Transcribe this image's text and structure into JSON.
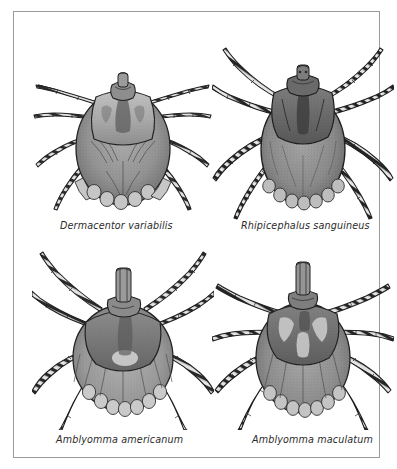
{
  "page": {
    "kind": "scientific-illustration-plate",
    "background_color": "#ffffff",
    "frame_color": "#9a9a9a",
    "text_color": "#2b2b2b",
    "layout": "2x2 grid of tick illustrations with italic species captions"
  },
  "figures": [
    {
      "id": "dermacentor-variabilis",
      "label": "Dermacentor variabilis",
      "common_name": "",
      "position": "top-left",
      "art": {
        "style": "grayscale stippled ink drawing, dorsal view",
        "body_fill": "#8d8d8d",
        "scutum_fill": "#a8a8a8",
        "outline": "#2a2a2a",
        "leg_bands": "alternating dark and pale bands",
        "festoons": 11,
        "legs": 8,
        "body_shape": "broad oval / teardrop",
        "scutum_shape": "broad ornate scutum covering front third",
        "notes": "American dog tick; ornate pale mottled scutum, fan-shaped striations on idiosoma"
      }
    },
    {
      "id": "rhipicephalus-sanguineus",
      "label": "Rhipicephalus sanguineus",
      "common_name": "",
      "position": "top-right",
      "art": {
        "style": "grayscale stippled ink drawing, dorsal view",
        "body_fill": "#8a8a8a",
        "scutum_fill": "#6e6e6e",
        "outline": "#262626",
        "leg_bands": "strongly banded, long splayed legs",
        "festoons": 11,
        "legs": 8,
        "body_shape": "narrow elongate oval",
        "scutum_shape": "dark hexagonal scutum, inornate",
        "notes": "Brown dog tick; hexagonal basis capituli, long outward-sweeping legs"
      }
    },
    {
      "id": "amblyomma-americanum",
      "label": "Amblyomma americanum",
      "common_name": "",
      "position": "bottom-left",
      "art": {
        "style": "grayscale stippled ink drawing, dorsal view",
        "body_fill": "#9b9b9b",
        "scutum_fill": "#7c7c7c",
        "outline": "#2a2a2a",
        "leg_bands": "banded legs, long capitulum",
        "festoons": 11,
        "legs": 8,
        "body_shape": "rounded oval",
        "scutum_shape": "large shield with single pale spot at rear margin",
        "notes": "Lone star tick; prominent single white dot on scutum, long mouthparts"
      }
    },
    {
      "id": "amblyomma-maculatum",
      "label": "Amblyomma maculatum",
      "common_name": "",
      "position": "bottom-right",
      "art": {
        "style": "grayscale stippled ink drawing, dorsal view",
        "body_fill": "#8f8f8f",
        "scutum_fill": "#707070",
        "outline": "#272727",
        "leg_bands": "banded legs, long spiny legs",
        "festoons": 11,
        "legs": 8,
        "body_shape": "broad oval",
        "scutum_shape": "ornate scutum with pale lateral blotches",
        "notes": "Gulf Coast tick; ornate scutum with pale markings, very long mouthparts"
      }
    }
  ]
}
